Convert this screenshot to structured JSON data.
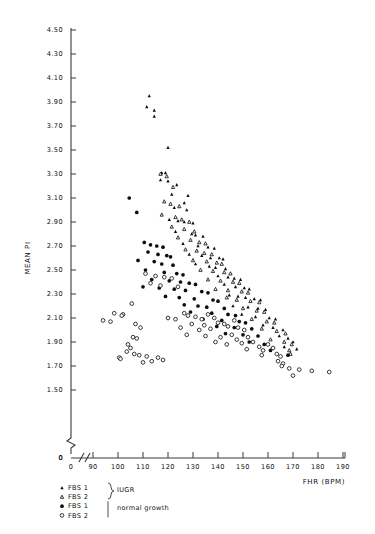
{
  "chart_data": {
    "type": "scatter",
    "title": "",
    "xlabel": "FHR (BPM)",
    "ylabel": "MEAN PI",
    "xlim": [
      86,
      192
    ],
    "ylim": [
      1.42,
      4.52
    ],
    "grid": false,
    "axis_break_x": true,
    "axis_break_y": true,
    "x_origin_label": "0",
    "y_origin_label": "0",
    "xticks": [
      90,
      100,
      110,
      120,
      130,
      140,
      150,
      160,
      170,
      180,
      190
    ],
    "xtick_labels": [
      "90",
      "100",
      "110",
      "120",
      "130",
      "140",
      "150",
      "160",
      "170",
      "180",
      "190"
    ],
    "yticks": [
      1.5,
      1.7,
      1.9,
      2.1,
      2.3,
      2.5,
      2.7,
      2.9,
      3.1,
      3.3,
      3.5,
      3.7,
      3.9,
      4.1,
      4.3,
      4.5
    ],
    "ytick_labels": [
      "1.50",
      "1.70",
      "1.90",
      "2.10",
      "2.30",
      "2.50",
      "2.70",
      "2.90",
      "3.10",
      "3.30",
      "3.50",
      "3.70",
      "3.90",
      "4.10",
      "4.30",
      "4.50"
    ],
    "legend_position": "below-axes",
    "series": [
      {
        "name": "FBS 1",
        "group": "IUGR",
        "marker": "filled-triangle",
        "color": "#0d0d0d",
        "points": [
          [
            112.5,
            3.95
          ],
          [
            111.5,
            3.86
          ],
          [
            114.5,
            3.83
          ],
          [
            114.5,
            3.78
          ],
          [
            120.0,
            3.52
          ],
          [
            117.5,
            3.31
          ],
          [
            119.0,
            3.31
          ],
          [
            117.0,
            3.25
          ],
          [
            120.0,
            3.24
          ],
          [
            123.5,
            3.21
          ],
          [
            121.5,
            3.13
          ],
          [
            128.0,
            3.12
          ],
          [
            126.5,
            3.06
          ],
          [
            122.5,
            3.02
          ],
          [
            127.5,
            3.0
          ],
          [
            120.5,
            2.92
          ],
          [
            124.0,
            2.91
          ],
          [
            126.5,
            2.9
          ],
          [
            130.0,
            2.89
          ],
          [
            123.0,
            2.82
          ],
          [
            129.5,
            2.8
          ],
          [
            131.0,
            2.79
          ],
          [
            134.0,
            2.78
          ],
          [
            126.0,
            2.72
          ],
          [
            132.0,
            2.7
          ],
          [
            136.0,
            2.69
          ],
          [
            138.5,
            2.68
          ],
          [
            128.5,
            2.63
          ],
          [
            133.5,
            2.62
          ],
          [
            137.0,
            2.6
          ],
          [
            140.5,
            2.6
          ],
          [
            142.0,
            2.59
          ],
          [
            131.0,
            2.55
          ],
          [
            136.5,
            2.53
          ],
          [
            139.0,
            2.52
          ],
          [
            143.0,
            2.51
          ],
          [
            140.0,
            2.45
          ],
          [
            144.0,
            2.44
          ],
          [
            146.5,
            2.43
          ],
          [
            149.0,
            2.42
          ],
          [
            142.5,
            2.38
          ],
          [
            147.0,
            2.36
          ],
          [
            150.5,
            2.35
          ],
          [
            152.5,
            2.34
          ],
          [
            144.5,
            2.29
          ],
          [
            148.0,
            2.28
          ],
          [
            151.0,
            2.27
          ],
          [
            154.5,
            2.26
          ],
          [
            157.0,
            2.25
          ],
          [
            146.0,
            2.2
          ],
          [
            152.0,
            2.19
          ],
          [
            156.0,
            2.18
          ],
          [
            159.0,
            2.17
          ],
          [
            149.5,
            2.13
          ],
          [
            155.0,
            2.11
          ],
          [
            160.5,
            2.1
          ],
          [
            163.0,
            2.09
          ],
          [
            158.0,
            2.04
          ],
          [
            162.0,
            2.02
          ],
          [
            166.0,
            2.0
          ],
          [
            164.5,
            1.95
          ],
          [
            168.0,
            1.93
          ],
          [
            170.0,
            1.9
          ],
          [
            166.5,
            1.86
          ],
          [
            171.5,
            1.84
          ]
        ]
      },
      {
        "name": "FBS 2",
        "group": "IUGR",
        "marker": "open-triangle",
        "color": "#171717",
        "points": [
          [
            117.0,
            3.3
          ],
          [
            119.5,
            3.28
          ],
          [
            122.0,
            3.19
          ],
          [
            118.5,
            3.07
          ],
          [
            121.0,
            3.05
          ],
          [
            124.5,
            3.03
          ],
          [
            117.5,
            2.96
          ],
          [
            123.0,
            2.94
          ],
          [
            125.5,
            2.92
          ],
          [
            128.5,
            2.9
          ],
          [
            121.5,
            2.86
          ],
          [
            126.5,
            2.84
          ],
          [
            130.5,
            2.82
          ],
          [
            124.0,
            2.77
          ],
          [
            129.0,
            2.75
          ],
          [
            132.5,
            2.73
          ],
          [
            135.0,
            2.72
          ],
          [
            127.0,
            2.67
          ],
          [
            131.5,
            2.66
          ],
          [
            134.5,
            2.64
          ],
          [
            137.5,
            2.63
          ],
          [
            130.0,
            2.58
          ],
          [
            135.5,
            2.57
          ],
          [
            139.5,
            2.56
          ],
          [
            141.5,
            2.55
          ],
          [
            133.0,
            2.5
          ],
          [
            138.0,
            2.49
          ],
          [
            142.5,
            2.48
          ],
          [
            145.0,
            2.47
          ],
          [
            136.0,
            2.42
          ],
          [
            141.0,
            2.41
          ],
          [
            146.0,
            2.4
          ],
          [
            148.5,
            2.39
          ],
          [
            139.0,
            2.34
          ],
          [
            144.0,
            2.33
          ],
          [
            149.5,
            2.32
          ],
          [
            152.0,
            2.31
          ],
          [
            143.5,
            2.27
          ],
          [
            147.5,
            2.25
          ],
          [
            153.0,
            2.24
          ],
          [
            156.5,
            2.23
          ],
          [
            150.0,
            2.18
          ],
          [
            155.5,
            2.16
          ],
          [
            158.5,
            2.15
          ],
          [
            153.5,
            2.09
          ],
          [
            159.5,
            2.07
          ],
          [
            162.5,
            2.06
          ],
          [
            157.5,
            2.01
          ],
          [
            163.5,
            1.99
          ],
          [
            167.0,
            1.97
          ],
          [
            161.0,
            1.92
          ],
          [
            166.5,
            1.9
          ],
          [
            169.5,
            1.88
          ],
          [
            168.5,
            1.83
          ],
          [
            169.0,
            1.8
          ]
        ]
      },
      {
        "name": "FBS 1",
        "group": "normal growth",
        "marker": "filled-circle",
        "color": "#0d0d0d",
        "points": [
          [
            104.5,
            3.1
          ],
          [
            107.5,
            2.98
          ],
          [
            110.5,
            2.73
          ],
          [
            113.0,
            2.71
          ],
          [
            115.5,
            2.7
          ],
          [
            118.0,
            2.69
          ],
          [
            112.0,
            2.65
          ],
          [
            116.0,
            2.63
          ],
          [
            119.5,
            2.62
          ],
          [
            121.0,
            2.61
          ],
          [
            108.0,
            2.58
          ],
          [
            114.5,
            2.57
          ],
          [
            117.5,
            2.55
          ],
          [
            122.0,
            2.54
          ],
          [
            111.0,
            2.5
          ],
          [
            118.5,
            2.48
          ],
          [
            123.5,
            2.47
          ],
          [
            126.0,
            2.46
          ],
          [
            113.5,
            2.42
          ],
          [
            120.5,
            2.41
          ],
          [
            125.0,
            2.4
          ],
          [
            128.5,
            2.39
          ],
          [
            131.0,
            2.38
          ],
          [
            110.0,
            2.36
          ],
          [
            116.5,
            2.35
          ],
          [
            122.5,
            2.34
          ],
          [
            127.0,
            2.33
          ],
          [
            133.5,
            2.32
          ],
          [
            136.0,
            2.31
          ],
          [
            119.0,
            2.28
          ],
          [
            124.5,
            2.27
          ],
          [
            130.5,
            2.26
          ],
          [
            138.0,
            2.25
          ],
          [
            140.0,
            2.24
          ],
          [
            126.5,
            2.21
          ],
          [
            132.0,
            2.2
          ],
          [
            135.5,
            2.19
          ],
          [
            142.5,
            2.18
          ],
          [
            129.0,
            2.15
          ],
          [
            137.5,
            2.14
          ],
          [
            144.0,
            2.13
          ],
          [
            147.0,
            2.12
          ],
          [
            134.0,
            2.09
          ],
          [
            141.5,
            2.08
          ],
          [
            148.5,
            2.07
          ],
          [
            151.0,
            2.06
          ],
          [
            139.5,
            2.03
          ],
          [
            146.5,
            2.02
          ],
          [
            153.5,
            2.01
          ],
          [
            143.0,
            1.97
          ],
          [
            150.0,
            1.96
          ],
          [
            156.0,
            1.95
          ],
          [
            152.5,
            1.9
          ],
          [
            158.5,
            1.88
          ],
          [
            161.0,
            1.83
          ],
          [
            168.0,
            1.79
          ]
        ]
      },
      {
        "name": "FBS 2",
        "group": "normal growth",
        "marker": "open-circle",
        "color": "#171717",
        "points": [
          [
            98.5,
            2.14
          ],
          [
            102.0,
            2.13
          ],
          [
            105.5,
            2.22
          ],
          [
            107.0,
            2.05
          ],
          [
            109.0,
            2.02
          ],
          [
            106.0,
            1.94
          ],
          [
            107.5,
            1.93
          ],
          [
            111.0,
            2.47
          ],
          [
            115.0,
            2.45
          ],
          [
            118.5,
            2.44
          ],
          [
            121.5,
            2.43
          ],
          [
            113.0,
            2.39
          ],
          [
            117.0,
            2.37
          ],
          [
            124.0,
            2.36
          ],
          [
            94.0,
            2.08
          ],
          [
            97.0,
            2.07
          ],
          [
            101.5,
            2.12
          ],
          [
            104.0,
            1.88
          ],
          [
            105.0,
            1.85
          ],
          [
            103.5,
            1.82
          ],
          [
            106.5,
            1.8
          ],
          [
            100.5,
            1.77
          ],
          [
            101.0,
            1.76
          ],
          [
            108.5,
            1.79
          ],
          [
            111.5,
            1.78
          ],
          [
            110.0,
            1.73
          ],
          [
            113.5,
            1.74
          ],
          [
            116.0,
            1.77
          ],
          [
            118.0,
            1.75
          ],
          [
            120.0,
            2.1
          ],
          [
            123.0,
            2.09
          ],
          [
            126.5,
            2.14
          ],
          [
            128.0,
            2.12
          ],
          [
            131.0,
            2.11
          ],
          [
            133.5,
            2.09
          ],
          [
            136.0,
            2.13
          ],
          [
            138.5,
            2.1
          ],
          [
            129.5,
            2.05
          ],
          [
            134.5,
            2.04
          ],
          [
            140.0,
            2.06
          ],
          [
            142.5,
            2.05
          ],
          [
            125.0,
            2.02
          ],
          [
            132.5,
            2.0
          ],
          [
            137.0,
            2.01
          ],
          [
            144.0,
            2.03
          ],
          [
            146.5,
            2.08
          ],
          [
            148.0,
            2.02
          ],
          [
            150.5,
            2.0
          ],
          [
            127.5,
            1.96
          ],
          [
            135.0,
            1.95
          ],
          [
            141.0,
            1.94
          ],
          [
            145.5,
            1.96
          ],
          [
            139.0,
            1.9
          ],
          [
            147.5,
            1.92
          ],
          [
            152.0,
            1.94
          ],
          [
            143.5,
            1.88
          ],
          [
            149.5,
            1.89
          ],
          [
            154.0,
            1.9
          ],
          [
            151.5,
            1.84
          ],
          [
            156.5,
            1.86
          ],
          [
            158.0,
            1.83
          ],
          [
            160.0,
            1.88
          ],
          [
            162.0,
            1.85
          ],
          [
            157.5,
            1.79
          ],
          [
            163.5,
            1.8
          ],
          [
            165.0,
            1.78
          ],
          [
            164.0,
            1.74
          ],
          [
            166.0,
            1.72
          ],
          [
            165.5,
            1.7
          ],
          [
            168.5,
            1.68
          ],
          [
            172.5,
            1.67
          ],
          [
            177.5,
            1.66
          ],
          [
            184.5,
            1.65
          ],
          [
            170.0,
            1.62
          ]
        ]
      }
    ]
  },
  "axes": {
    "y_title": "MEAN PI",
    "x_title": "FHR (BPM)",
    "x_zero": "0",
    "y_zero": "0"
  },
  "legend": {
    "entries": [
      {
        "marker": "filled-triangle",
        "label": "FBS 1"
      },
      {
        "marker": "open-triangle",
        "label": "FBS 2"
      },
      {
        "marker": "filled-circle",
        "label": "FBS 1"
      },
      {
        "marker": "open-circle",
        "label": "FBS 2"
      }
    ],
    "group_labels": [
      "IUGR",
      "normal growth"
    ]
  }
}
